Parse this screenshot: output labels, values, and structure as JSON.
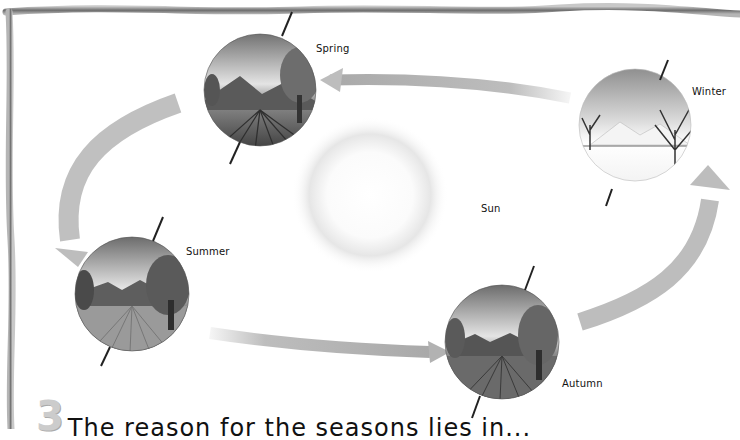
{
  "diagram": {
    "center": {
      "label": "Sun"
    },
    "seasons": [
      {
        "label": "Spring"
      },
      {
        "label": "Winter"
      },
      {
        "label": "Summer"
      },
      {
        "label": "Autumn"
      }
    ],
    "colors": {
      "frame": "#8a8a8a",
      "arrow": "#bdbdbd",
      "axis": "#222222",
      "sun_glow": "#d9d9d9",
      "text": "#111111"
    }
  },
  "footer": {
    "step_number": "3",
    "text": "The reason for the seasons lies in..."
  }
}
